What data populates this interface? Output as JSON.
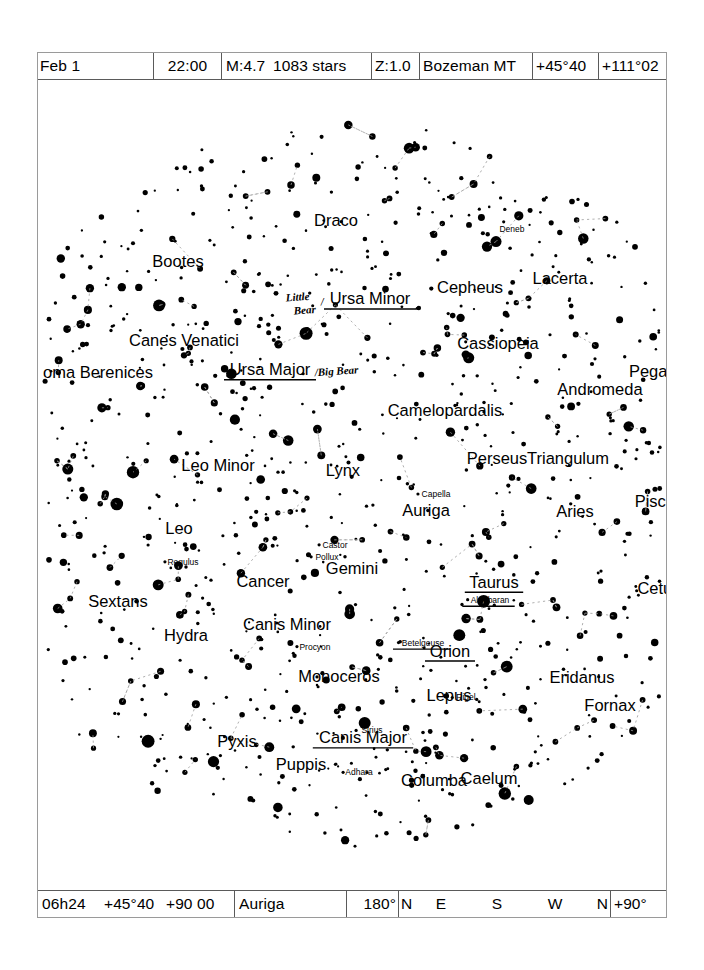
{
  "header": {
    "date": "Feb 1",
    "time": "22:00",
    "magnitude": "M:4.7",
    "star_count": "1083 stars",
    "zoom": "Z:1.0",
    "location": "Bozeman MT",
    "latitude": "+45°40",
    "longitude": "+111°02"
  },
  "footer": {
    "ra": "06h24",
    "dec": "+45°40",
    "alt_az": "+90 00",
    "constellation": "Auriga",
    "field": "180°",
    "compass": [
      "N",
      "E",
      "S",
      "W",
      "N"
    ],
    "elevation": "+90°"
  },
  "chart_data": {
    "type": "scatter",
    "projection": "all-sky circular horizon view",
    "constellations": [
      {
        "label": "Draco",
        "x": 298,
        "y": 146,
        "size": 16.5
      },
      {
        "label": "Deneb",
        "x": 474,
        "y": 152,
        "size": 8.5,
        "kind": "star",
        "dot": false
      },
      {
        "label": "Bootes",
        "x": 140,
        "y": 187,
        "size": 16.5
      },
      {
        "label": "Cepheus",
        "x": 432,
        "y": 214,
        "size": 16.5
      },
      {
        "label": "Lacerta",
        "x": 522,
        "y": 205,
        "size": 16.5
      },
      {
        "label": "Ursa Minor",
        "x": 332,
        "y": 225,
        "size": 16.5,
        "underline": true
      },
      {
        "label": "Canes Venatici",
        "x": 146,
        "y": 267,
        "size": 16.5
      },
      {
        "label": "Cassiopeia",
        "x": 460,
        "y": 270,
        "size": 16.5
      },
      {
        "label": "Ursa Major",
        "x": 232,
        "y": 296,
        "size": 16.5,
        "underline": true
      },
      {
        "label": "oma Berenices",
        "x": 60,
        "y": 299,
        "size": 16.5
      },
      {
        "label": "Pegasus",
        "x": 623,
        "y": 298,
        "size": 16.5
      },
      {
        "label": "Andromeda",
        "x": 562,
        "y": 316,
        "size": 16.5
      },
      {
        "label": "Camelopardalis",
        "x": 407,
        "y": 337,
        "size": 16.5
      },
      {
        "label": "Perseus",
        "x": 459,
        "y": 385,
        "size": 16.5
      },
      {
        "label": "Triangulum",
        "x": 530,
        "y": 385,
        "size": 16.5
      },
      {
        "label": "Leo Minor",
        "x": 180,
        "y": 392,
        "size": 16.5
      },
      {
        "label": "Lynx",
        "x": 305,
        "y": 397,
        "size": 16.5
      },
      {
        "label": "Capella",
        "x": 398,
        "y": 418,
        "size": 8.5,
        "kind": "star"
      },
      {
        "label": "Auriga",
        "x": 388,
        "y": 437,
        "size": 16.5
      },
      {
        "label": "Aries",
        "x": 537,
        "y": 438,
        "size": 16.5
      },
      {
        "label": "Pisces",
        "x": 621,
        "y": 428,
        "size": 16.5
      },
      {
        "label": "Leo",
        "x": 141,
        "y": 455,
        "size": 16.5
      },
      {
        "label": "Castor",
        "x": 297,
        "y": 469,
        "size": 8.5,
        "kind": "star"
      },
      {
        "label": "Pollux",
        "x": 289,
        "y": 481,
        "size": 8.5,
        "kind": "star"
      },
      {
        "label": "Regulus",
        "x": 145,
        "y": 486,
        "size": 8.5,
        "kind": "star"
      },
      {
        "label": "Gemini",
        "x": 314,
        "y": 495,
        "size": 16.5
      },
      {
        "label": "Cancer",
        "x": 225,
        "y": 508,
        "size": 16.5
      },
      {
        "label": "Taurus",
        "x": 456,
        "y": 509,
        "size": 16.5,
        "underline": true
      },
      {
        "label": "Cetus",
        "x": 621,
        "y": 515,
        "size": 16.5
      },
      {
        "label": "Aldebaran",
        "x": 452,
        "y": 524,
        "size": 8.5,
        "kind": "star",
        "underline": true
      },
      {
        "label": "Sextans",
        "x": 80,
        "y": 528,
        "size": 16.5
      },
      {
        "label": "Canis Minor",
        "x": 249,
        "y": 551,
        "size": 16.5
      },
      {
        "label": "Hydra",
        "x": 148,
        "y": 562,
        "size": 16.5
      },
      {
        "label": "Betelgeuse",
        "x": 385,
        "y": 567,
        "size": 8.5,
        "kind": "star",
        "underline": true
      },
      {
        "label": "Procyon",
        "x": 277,
        "y": 571,
        "size": 8.5,
        "kind": "star"
      },
      {
        "label": "Orion",
        "x": 412,
        "y": 578,
        "size": 16.5,
        "underline": true
      },
      {
        "label": "Monoceros",
        "x": 301,
        "y": 603,
        "size": 16.5
      },
      {
        "label": "Eridanus",
        "x": 544,
        "y": 604,
        "size": 16.5
      },
      {
        "label": "Rigel",
        "x": 428,
        "y": 622,
        "size": 8.5,
        "kind": "star"
      },
      {
        "label": "Fornax",
        "x": 572,
        "y": 633,
        "size": 16.5
      },
      {
        "label": "Lepus",
        "x": 411,
        "y": 623,
        "size": 16.5
      },
      {
        "label": "Sirius",
        "x": 334,
        "y": 655,
        "size": 8.5,
        "kind": "star"
      },
      {
        "label": "Canis Major",
        "x": 325,
        "y": 665,
        "size": 16.5,
        "underline": true
      },
      {
        "label": "Pyxis",
        "x": 199,
        "y": 669,
        "size": 16.5
      },
      {
        "label": "Puppis",
        "x": 263,
        "y": 692,
        "size": 16.5
      },
      {
        "label": "Adhara",
        "x": 321,
        "y": 697,
        "size": 8.5,
        "kind": "star"
      },
      {
        "label": "Columba",
        "x": 396,
        "y": 708,
        "size": 16.5
      },
      {
        "label": "Caelum",
        "x": 451,
        "y": 706,
        "size": 16.5
      }
    ],
    "annotations": [
      {
        "text": "Little",
        "x": 248,
        "y": 222,
        "kind": "handwritten"
      },
      {
        "text": "Bear",
        "x": 256,
        "y": 235,
        "kind": "handwritten"
      },
      {
        "text": "/",
        "x": 283,
        "y": 226,
        "kind": "handwritten"
      },
      {
        "text": "/Big Bear",
        "x": 277,
        "y": 297,
        "kind": "handwritten"
      }
    ]
  }
}
